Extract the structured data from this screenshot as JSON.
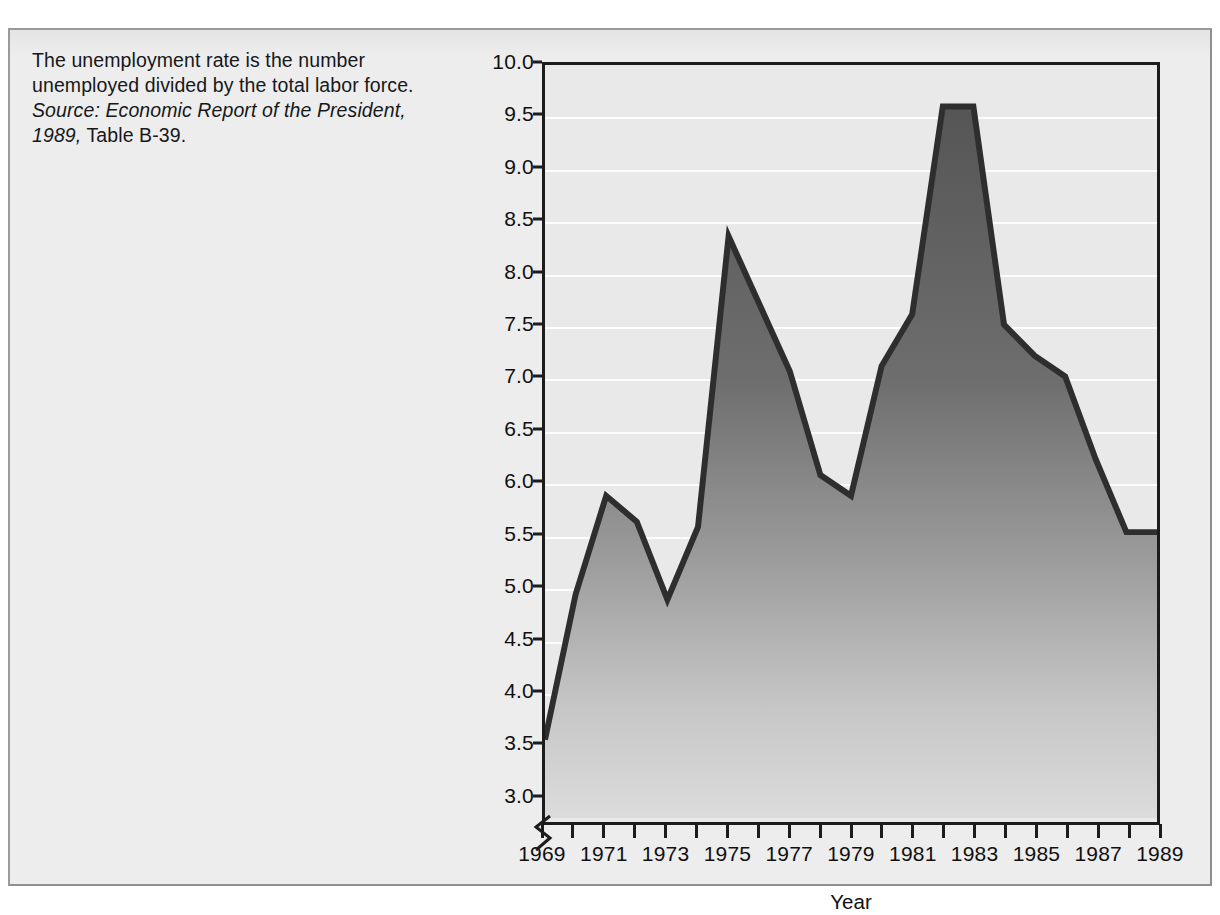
{
  "caption": {
    "body": "The unemployment rate is the number unemployed divided by the total labor force.",
    "source_italic": "Source: Economic Report of the President, 1989,",
    "source_roman": " Table B-39."
  },
  "colors": {
    "page_background": "#ffffff",
    "figure_background": "#ebebeb",
    "figure_border": "#8f8f8f",
    "plot_background": "#e9e9e9",
    "gridline": "#fdfdfd",
    "axis": "#1c1c1c",
    "area_fill_top": "#5a5a5a",
    "area_fill_bottom": "#d8d8d8",
    "area_outline": "#303030",
    "text": "#101010"
  },
  "chart_data": {
    "type": "area",
    "title": "",
    "xlabel": "Year",
    "ylabel": "Unemployment as Percentage of Labor Force",
    "xlim": [
      1969,
      1989
    ],
    "ylim": [
      2.75,
      10.0
    ],
    "y_axis_break": true,
    "grid": true,
    "legend": "none",
    "y_ticks": [
      3.0,
      3.5,
      4.0,
      4.5,
      5.0,
      5.5,
      6.0,
      6.5,
      7.0,
      7.5,
      8.0,
      8.5,
      9.0,
      9.5,
      10.0
    ],
    "y_tick_labels": [
      "3.0",
      "3.5",
      "4.0",
      "4.5",
      "5.0",
      "5.5",
      "6.0",
      "6.5",
      "7.0",
      "7.5",
      "8.0",
      "8.5",
      "9.0",
      "9.5",
      "10.0"
    ],
    "x_ticks": [
      1969,
      1970,
      1971,
      1972,
      1973,
      1974,
      1975,
      1976,
      1977,
      1978,
      1979,
      1980,
      1981,
      1982,
      1983,
      1984,
      1985,
      1986,
      1987,
      1988,
      1989
    ],
    "x_tick_labels_shown": [
      "1969",
      "1971",
      "1973",
      "1975",
      "1977",
      "1979",
      "1981",
      "1983",
      "1985",
      "1987",
      "1989"
    ],
    "x": [
      1969,
      1970,
      1971,
      1972,
      1973,
      1974,
      1975,
      1976,
      1977,
      1978,
      1979,
      1980,
      1981,
      1982,
      1983,
      1984,
      1985,
      1986,
      1987,
      1988,
      1989
    ],
    "values": [
      3.5,
      4.9,
      5.85,
      5.6,
      4.85,
      5.55,
      8.35,
      7.7,
      7.05,
      6.05,
      5.85,
      7.1,
      7.6,
      9.6,
      9.6,
      7.5,
      7.2,
      7.0,
      6.2,
      5.5,
      5.5
    ]
  }
}
